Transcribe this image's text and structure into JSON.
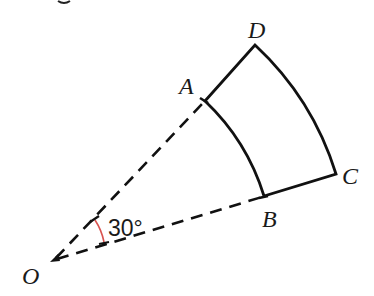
{
  "figure": {
    "type": "annular-sector",
    "angle_label": "30°",
    "angle_degrees": 30,
    "points": {
      "O": "O",
      "A": "A",
      "B": "B",
      "C": "C",
      "D": "D"
    },
    "colors": {
      "fill": "#6db7ea",
      "outline": "#111111",
      "angle_arc": "#d9534f",
      "dashed_lines": "#111111"
    }
  }
}
